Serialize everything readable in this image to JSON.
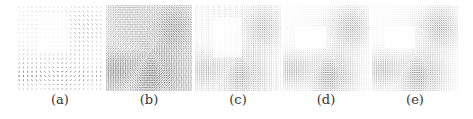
{
  "figure": {
    "panels": [
      {
        "id": "a",
        "caption": "(a)",
        "style": "sparse",
        "left": 17
      },
      {
        "id": "b",
        "caption": "(b)",
        "style": "dense-dark",
        "left": 106
      },
      {
        "id": "c",
        "caption": "(c)",
        "style": "dense-light",
        "left": 195
      },
      {
        "id": "d",
        "caption": "(d)",
        "style": "smooth",
        "left": 283
      },
      {
        "id": "e",
        "caption": "(e)",
        "style": "smooth",
        "left": 372
      }
    ],
    "colors": {
      "ink": "#333333",
      "background": "#ffffff"
    }
  }
}
